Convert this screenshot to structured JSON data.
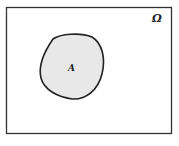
{
  "diagram": {
    "type": "venn-single-set",
    "universe": {
      "label": "Ω",
      "stroke": "#333333",
      "fill": "#ffffff"
    },
    "set": {
      "label": "A",
      "stroke": "#222222",
      "fill": "#e8e8e8"
    }
  }
}
